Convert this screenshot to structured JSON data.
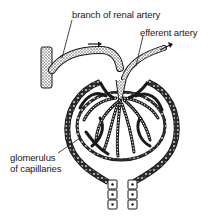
{
  "diagram": {
    "labels": {
      "renal_artery": "branch of renal artery",
      "efferent_artery": "efferent artery",
      "glomerulus_line1": "glomerulus",
      "glomerulus_line2": "of capillaries"
    },
    "parts": [
      "renal-artery-branch",
      "afferent-arteriole",
      "efferent-arteriole",
      "glomerular-capillaries",
      "bowmans-capsule",
      "proximal-tubule"
    ],
    "flow_arrows": [
      "afferent-direction",
      "efferent-direction"
    ],
    "colors": {
      "ink": "#1a1a1a",
      "stipple": "#555555",
      "background": "#ffffff"
    }
  }
}
